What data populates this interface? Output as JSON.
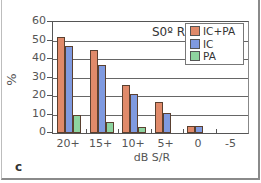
{
  "chart_data": {
    "type": "bar",
    "title": "S0º RIC",
    "xlabel": "dB S/R",
    "ylabel": "%",
    "categories": [
      "20+",
      "15+",
      "10+",
      "5+",
      "0",
      "-5"
    ],
    "series": [
      {
        "name": "IC+PA",
        "color": "#e08a6a",
        "values": [
          52,
          45,
          26,
          17,
          4,
          0
        ]
      },
      {
        "name": "IC",
        "color": "#7f9ae0",
        "values": [
          47,
          37,
          21,
          11,
          4,
          0
        ]
      },
      {
        "name": "PA",
        "color": "#8ed4a0",
        "values": [
          10,
          6,
          3,
          0,
          0,
          0
        ]
      }
    ],
    "ylim": [
      0,
      60
    ],
    "yticks": [
      0,
      10,
      20,
      30,
      40,
      50,
      60
    ],
    "grid": true,
    "legend_position": "upper right"
  },
  "panel_label": "c"
}
